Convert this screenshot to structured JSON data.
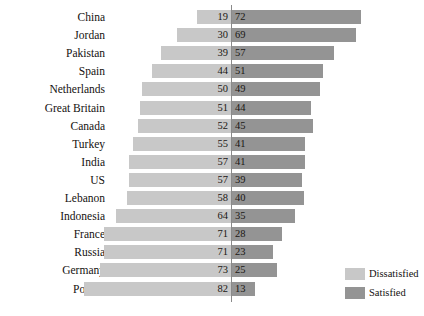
{
  "chart_data": {
    "type": "bar",
    "title": "",
    "xlabel": "",
    "ylabel": "",
    "orientation": "horizontal",
    "layout": "diverging",
    "grid": false,
    "legend_position": "bottom-right",
    "axis_center_value": 0,
    "categories": [
      "China",
      "Jordan",
      "Pakistan",
      "Spain",
      "Netherlands",
      "Great Britain",
      "Canada",
      "Turkey",
      "India",
      "US",
      "Lebanon",
      "Indonesia",
      "France",
      "Russia",
      "Germany",
      "Poland"
    ],
    "series": [
      {
        "name": "Dissatisfied",
        "color": "#c8c8c8",
        "direction": "left",
        "values": [
          19,
          30,
          39,
          44,
          50,
          51,
          52,
          55,
          57,
          57,
          58,
          64,
          71,
          71,
          73,
          82
        ]
      },
      {
        "name": "Satisfied",
        "color": "#949494",
        "direction": "right",
        "values": [
          72,
          69,
          57,
          51,
          49,
          44,
          45,
          41,
          41,
          39,
          40,
          35,
          28,
          23,
          25,
          13
        ]
      }
    ],
    "rows": [
      {
        "label": "China",
        "dissatisfied": 19,
        "satisfied": 72
      },
      {
        "label": "Jordan",
        "dissatisfied": 30,
        "satisfied": 69
      },
      {
        "label": "Pakistan",
        "dissatisfied": 39,
        "satisfied": 57
      },
      {
        "label": "Spain",
        "dissatisfied": 44,
        "satisfied": 51
      },
      {
        "label": "Netherlands",
        "dissatisfied": 50,
        "satisfied": 49
      },
      {
        "label": "Great Britain",
        "dissatisfied": 51,
        "satisfied": 44
      },
      {
        "label": "Canada",
        "dissatisfied": 52,
        "satisfied": 45
      },
      {
        "label": "Turkey",
        "dissatisfied": 55,
        "satisfied": 41
      },
      {
        "label": "India",
        "dissatisfied": 57,
        "satisfied": 41
      },
      {
        "label": "US",
        "dissatisfied": 57,
        "satisfied": 39
      },
      {
        "label": "Lebanon",
        "dissatisfied": 58,
        "satisfied": 40
      },
      {
        "label": "Indonesia",
        "dissatisfied": 64,
        "satisfied": 35
      },
      {
        "label": "France",
        "dissatisfied": 71,
        "satisfied": 28
      },
      {
        "label": "Russia",
        "dissatisfied": 71,
        "satisfied": 23
      },
      {
        "label": "Germany",
        "dissatisfied": 73,
        "satisfied": 25
      },
      {
        "label": "Poland",
        "dissatisfied": 82,
        "satisfied": 13
      }
    ]
  },
  "legend": {
    "items": [
      {
        "label": "Dissatisfied",
        "color": "#c8c8c8",
        "swatch_name": "dissatisfied"
      },
      {
        "label": "Satisfied",
        "color": "#949494",
        "swatch_name": "satisfied"
      }
    ]
  }
}
